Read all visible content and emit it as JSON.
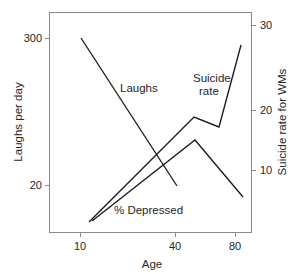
{
  "chart_data": {
    "type": "line",
    "title": "",
    "subtitle": "",
    "xlabel": "Age",
    "ylabel": "Laughs per day",
    "y2label": "Suicide rate for WMs",
    "grid": false,
    "legend": "inline-annotations",
    "xlim": [
      5,
      85
    ],
    "x_ticks": [
      10,
      40,
      80
    ],
    "x_tick_labels": [
      "10",
      "40",
      "80"
    ],
    "ylim": [
      0,
      330
    ],
    "y_ticks": [
      20,
      300
    ],
    "y_tick_labels": [
      "20",
      "300"
    ],
    "y2lim": [
      0,
      33
    ],
    "y2_ticks": [
      10,
      20,
      30
    ],
    "y2_tick_labels": [
      "10",
      "20",
      "30"
    ],
    "series": [
      {
        "name": "Laughs",
        "axis": "left",
        "label": "Laughs",
        "x": [
          10,
          42
        ],
        "values": [
          300,
          20
        ]
      },
      {
        "name": "Suicide rate",
        "axis": "right",
        "label": "Suicide rate",
        "x": [
          12,
          50,
          70,
          80
        ],
        "values": [
          3,
          19,
          17,
          28
        ]
      },
      {
        "name": "% Depressed",
        "axis": "left",
        "label": "% Depressed",
        "x": [
          13,
          50,
          80
        ],
        "values": [
          6,
          72,
          22
        ]
      }
    ],
    "annotations": [
      {
        "text": "Laughs",
        "x_px": 120,
        "y_px": 92
      },
      {
        "text": "Suicide",
        "x_px": 193,
        "y_px": 82
      },
      {
        "text": "rate",
        "x_px": 199,
        "y_px": 95
      },
      {
        "text": "% Depressed",
        "x_px": 114,
        "y_px": 214
      }
    ]
  },
  "axes": {
    "left": {
      "title": "Laughs per day",
      "ticks": [
        {
          "label": "300",
          "y_px": 38
        },
        {
          "label": "20",
          "y_px": 185
        }
      ]
    },
    "right": {
      "title": "Suicide rate for WMs",
      "ticks": [
        {
          "label": "30",
          "y_px": 25
        },
        {
          "label": "20",
          "y_px": 110
        },
        {
          "label": "10",
          "y_px": 170
        }
      ]
    },
    "bottom": {
      "title": "Age",
      "ticks": [
        {
          "label": "10",
          "x_px": 80
        },
        {
          "label": "40",
          "x_px": 175
        },
        {
          "label": "80",
          "x_px": 235
        }
      ]
    }
  },
  "colors": {
    "background": "#ffffff",
    "line": "#1a1a1a",
    "frame": "#8a8a8a",
    "text": "#262626"
  },
  "paths": {
    "laughs": "M 81,38 L 177,186",
    "suicide_rate": "M 89,222 L 194,117 L 219,127 L 241,45",
    "depressed": "M 92,221 L 195,140 L 243,197"
  }
}
